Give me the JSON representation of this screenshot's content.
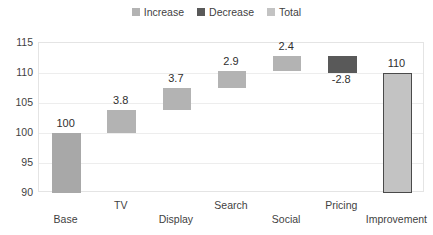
{
  "legend": {
    "position": "top-center",
    "items": [
      {
        "label": "Increase",
        "color": "#b3b3b3"
      },
      {
        "label": "Decrease",
        "color": "#595959"
      },
      {
        "label": "Total",
        "color": "#c3c3c3"
      }
    ]
  },
  "colors": {
    "increase": "#b3b3b3",
    "decrease": "#595959",
    "total": "#c3c3c3",
    "base": "#a8a8a8",
    "total_border": "#4a4a4a",
    "gridline": "#ededed",
    "plot_border": "#e4e4e4",
    "text": "#3f3f3f"
  },
  "chart_data": {
    "type": "bar",
    "subtype": "waterfall",
    "title": "",
    "xlabel": "",
    "ylabel": "",
    "ylim": [
      90,
      115
    ],
    "yticks": [
      115,
      110,
      105,
      100,
      95,
      90
    ],
    "ytick_labels": [
      "115",
      "110",
      "105",
      "100",
      "95",
      "90"
    ],
    "grid": true,
    "categories": [
      "Base",
      "TV",
      "Display",
      "Search",
      "Social",
      "Pricing",
      "Improvement"
    ],
    "values": [
      100,
      3.8,
      3.7,
      2.9,
      2.4,
      -2.8,
      110
    ],
    "data_labels": [
      "100",
      "3.8",
      "3.7",
      "2.9",
      "2.4",
      "-2.8",
      "110"
    ],
    "bars": [
      {
        "category": "Base",
        "label": "100",
        "value": 100,
        "kind": "total",
        "start": 90.0,
        "end": 100.0,
        "label_position": "above"
      },
      {
        "category": "TV",
        "label": "3.8",
        "value": 3.8,
        "kind": "increase",
        "start": 100.0,
        "end": 103.8,
        "label_position": "above"
      },
      {
        "category": "Display",
        "label": "3.7",
        "value": 3.7,
        "kind": "increase",
        "start": 103.8,
        "end": 107.5,
        "label_position": "above"
      },
      {
        "category": "Search",
        "label": "2.9",
        "value": 2.9,
        "kind": "increase",
        "start": 107.5,
        "end": 110.4,
        "label_position": "above"
      },
      {
        "category": "Social",
        "label": "2.4",
        "value": 2.4,
        "kind": "increase",
        "start": 110.4,
        "end": 112.8,
        "label_position": "above"
      },
      {
        "category": "Pricing",
        "label": "-2.8",
        "value": -2.8,
        "kind": "decrease",
        "start": 112.8,
        "end": 110.0,
        "label_position": "below"
      },
      {
        "category": "Improvement",
        "label": "110",
        "value": 110,
        "kind": "total",
        "start": 90.0,
        "end": 110.0,
        "label_position": "above"
      }
    ]
  }
}
